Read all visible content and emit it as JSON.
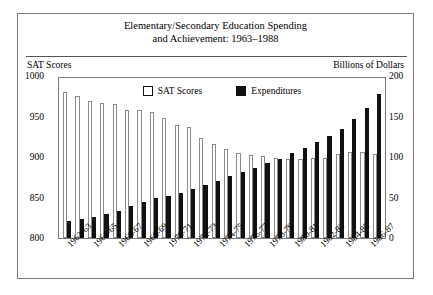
{
  "title": {
    "line1": "Elementary/Secondary Education Spending",
    "line2": "and Achievement: 1963–1988"
  },
  "axis_labels": {
    "left": "SAT Scores",
    "right": "Billions of Dollars"
  },
  "legend": [
    {
      "label": "SAT Scores",
      "swatch": "white-square-icon"
    },
    {
      "label": "Expenditures",
      "swatch": "black-square-icon"
    }
  ],
  "chart_data": {
    "type": "bar",
    "title": "Elementary/Secondary Education Spending and Achievement: 1963–1988",
    "xlabel": "",
    "ylabel": "SAT Scores",
    "y2label": "Billions of Dollars",
    "ylim": [
      800,
      1000
    ],
    "y2lim": [
      0,
      200
    ],
    "yticks": [
      800,
      850,
      900,
      950,
      1000
    ],
    "y2ticks": [
      0,
      50,
      100,
      150,
      200
    ],
    "grid": false,
    "legend_position": "top-center",
    "categories": [
      "1962-63",
      "1963-64",
      "1964-65",
      "1965-66",
      "1966-67",
      "1967-68",
      "1968-69",
      "1969-70",
      "1970-71",
      "1971-72",
      "1972-73",
      "1973-74",
      "1974-75",
      "1975-76",
      "1976-77",
      "1977-78",
      "1978-79",
      "1979-80",
      "1980-81",
      "1981-82",
      "1982-83",
      "1983-84",
      "1984-85",
      "1985-86",
      "1986-87",
      "1987-88"
    ],
    "tick_labels": [
      "1962-63",
      "1964-65",
      "1966-67",
      "1968-69",
      "1970-71",
      "1972-73",
      "1974-75",
      "1976-77",
      "1978-79",
      "1980-81",
      "1982-83",
      "1984-85",
      "1986-87"
    ],
    "series": [
      {
        "name": "SAT Scores",
        "axis": "left",
        "color": "#ffffff",
        "values": [
          980,
          975,
          969,
          967,
          966,
          958,
          958,
          955,
          948,
          940,
          937,
          924,
          916,
          910,
          905,
          903,
          901,
          899,
          898,
          897,
          899,
          899,
          904,
          906,
          906,
          904
        ]
      },
      {
        "name": "Expenditures",
        "axis": "right",
        "color": "#111111",
        "values": [
          21,
          24,
          26,
          30,
          33,
          39,
          44,
          49,
          52,
          56,
          60,
          65,
          71,
          76,
          81,
          87,
          93,
          98,
          105,
          111,
          118,
          126,
          135,
          147,
          160,
          178
        ]
      }
    ]
  }
}
